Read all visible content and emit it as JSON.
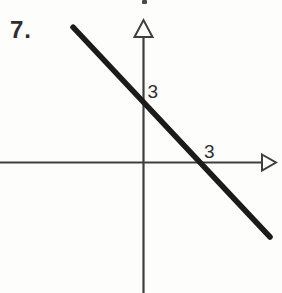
{
  "figure": {
    "problem_number": "7.",
    "background_color": "#fdfdfc",
    "axis_color": "#3e3e3e",
    "line_color": "#1b1b1b",
    "text_color": "#2e2e2e",
    "arrow_style": "open-triangle"
  },
  "chart_data": {
    "type": "line",
    "title": "",
    "xlabel": "",
    "ylabel": "",
    "grid": false,
    "x_intercept": 3,
    "y_intercept": 3,
    "tick_labels": {
      "x": "3",
      "y": "3"
    },
    "series": [
      {
        "name": "graphed-line",
        "x": [
          -3.67,
          6.59
        ],
        "y": [
          7.05,
          -3.88
        ]
      }
    ],
    "axes": {
      "x_range": [
        -7.48,
        6.9
      ],
      "y_range": [
        -6.8,
        7.42
      ],
      "arrows": [
        "x-positive",
        "y-positive"
      ]
    }
  }
}
